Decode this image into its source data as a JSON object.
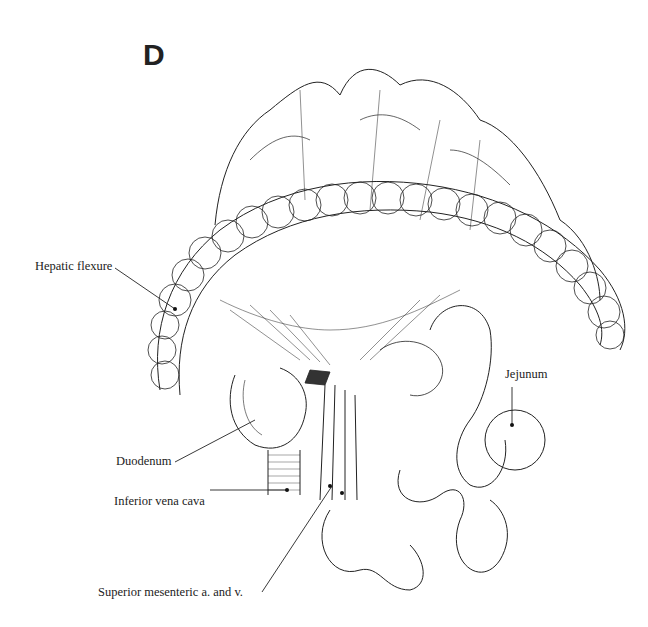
{
  "figure": {
    "panel_letter": "D",
    "labels": {
      "hepatic_flexure": "Hepatic flexure",
      "jejunum": "Jejunum",
      "duodenum": "Duodenum",
      "inferior_vena_cava": "Inferior vena cava",
      "superior_mesenteric": "Superior mesenteric a. and v."
    }
  }
}
